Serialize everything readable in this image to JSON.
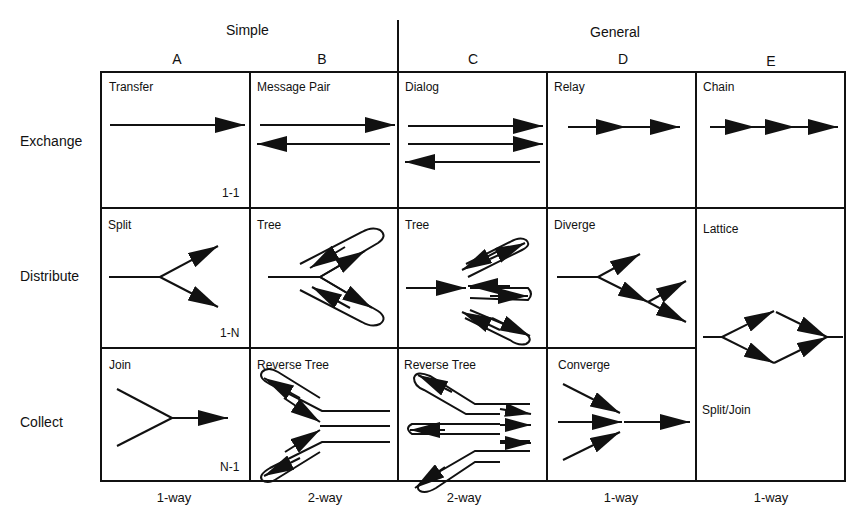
{
  "header": {
    "groups": [
      {
        "label": "Simple"
      },
      {
        "label": "General"
      }
    ],
    "columns": [
      {
        "label": "A"
      },
      {
        "label": "B"
      },
      {
        "label": "C"
      },
      {
        "label": "D"
      },
      {
        "label": "E"
      }
    ]
  },
  "rows": [
    {
      "label": "Exchange"
    },
    {
      "label": "Distribute"
    },
    {
      "label": "Collect"
    }
  ],
  "cells": {
    "A1": {
      "title": "Transfer",
      "note": "1-1"
    },
    "B1": {
      "title": "Message Pair"
    },
    "C1": {
      "title": "Dialog"
    },
    "D1": {
      "title": "Relay"
    },
    "E1": {
      "title": "Chain"
    },
    "A2": {
      "title": "Split",
      "note": "1-N"
    },
    "B2": {
      "title": "Tree"
    },
    "C2": {
      "title": "Tree"
    },
    "D2": {
      "title": "Diverge"
    },
    "E23": {
      "title": "Lattice",
      "subtitle": "Split/Join"
    },
    "A3": {
      "title": "Join",
      "note": "N-1"
    },
    "B3": {
      "title": "Reverse Tree"
    },
    "C3": {
      "title": "Reverse Tree"
    },
    "D3": {
      "title": "Converge"
    }
  },
  "footer": {
    "columns": [
      {
        "label": "1-way"
      },
      {
        "label": "2-way"
      },
      {
        "label": "2-way"
      },
      {
        "label": "1-way"
      },
      {
        "label": "1-way"
      }
    ]
  },
  "colors": {
    "ink": "#111111",
    "background": "#ffffff"
  }
}
